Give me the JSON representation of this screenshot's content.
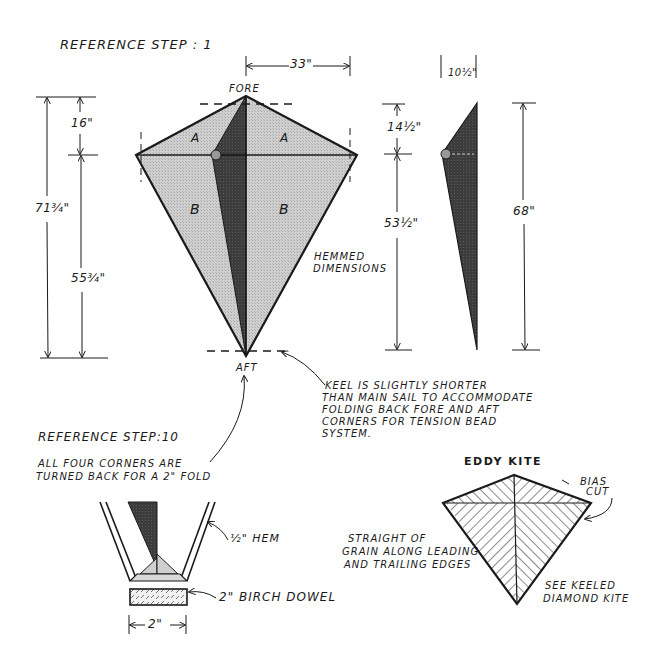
{
  "main_figure": {
    "title": "REFERENCE STEP : 1",
    "fore_label": "FORE",
    "aft_label": "AFT",
    "panel_labels": [
      "A",
      "A",
      "B",
      "B"
    ],
    "width_dim": "33\"",
    "left_dims": {
      "overall": "71¾\"",
      "top": "16\"",
      "bottom": "55¾\""
    },
    "keel_dims": {
      "width": "10½\"",
      "top": "14½\"",
      "bottom": "53½\"",
      "overall": "68\""
    },
    "hemmed_note": [
      "HEMMED",
      "DIMENSIONS"
    ],
    "keel_note": [
      "KEEL IS SLIGHTLY SHORTER",
      "THAN MAIN SAIL TO ACCOMMODATE",
      "FOLDING BACK FORE AND AFT",
      "CORNERS FOR TENSION BEAD",
      "SYSTEM."
    ]
  },
  "step10_detail": {
    "title": "REFERENCE STEP:10",
    "note": [
      "ALL FOUR CORNERS ARE",
      "TURNED BACK FOR A 2\" FOLD"
    ],
    "hem_label": "½\" HEM",
    "dowel_label": "2\" BIRCH DOWEL",
    "width_dim": "2\""
  },
  "eddy_kite": {
    "title": "EDDY KITE",
    "bias_cut_label": [
      "BIAS",
      "CUT"
    ],
    "grain_note": [
      "STRAIGHT OF",
      "GRAIN ALONG LEADING",
      "AND TRAILING EDGES"
    ],
    "see_note": [
      "SEE KEELED",
      "DIAMOND KITE"
    ]
  },
  "colors": {
    "ink": "#1a1a1a",
    "sail_fill": "#c8c8c8",
    "keel_fill": "#3a3a3a",
    "background": "#ffffff"
  }
}
